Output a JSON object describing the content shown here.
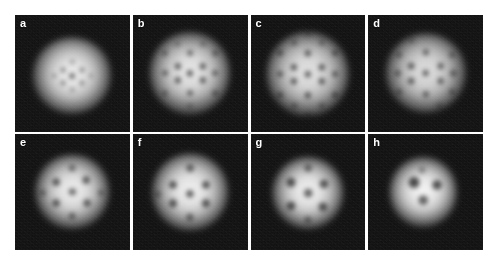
{
  "figure": {
    "kind": "absorption-image-grid",
    "columns": 4,
    "rows": 2,
    "background_color": "#ffffff",
    "panel_background_color": "#0a0a0a",
    "cloud_color": "#ffffff",
    "vortex_color": "#000000"
  },
  "chart_data": {
    "type": "heatmap",
    "title": "",
    "xlabel": "",
    "ylabel": "",
    "panels": [
      {
        "label": "a",
        "vortex_count": 9,
        "cloud": {
          "cx": 50,
          "cy": 52,
          "rx": 34,
          "ry": 33,
          "brightness": 0.92,
          "blur": 3.4
        },
        "vortices": [
          {
            "x": 50,
            "y": 52,
            "r": 3.0,
            "depth": 0.55
          },
          {
            "x": 42,
            "y": 47,
            "r": 2.6,
            "depth": 0.42
          },
          {
            "x": 58,
            "y": 47,
            "r": 2.6,
            "depth": 0.4
          },
          {
            "x": 42,
            "y": 58,
            "r": 2.6,
            "depth": 0.4
          },
          {
            "x": 58,
            "y": 58,
            "r": 2.6,
            "depth": 0.38
          },
          {
            "x": 50,
            "y": 40,
            "r": 2.4,
            "depth": 0.32
          },
          {
            "x": 50,
            "y": 64,
            "r": 2.4,
            "depth": 0.32
          },
          {
            "x": 34,
            "y": 52,
            "r": 2.4,
            "depth": 0.3
          },
          {
            "x": 66,
            "y": 52,
            "r": 2.4,
            "depth": 0.3
          }
        ]
      },
      {
        "label": "b",
        "vortex_count": 16,
        "cloud": {
          "cx": 50,
          "cy": 50,
          "rx": 35,
          "ry": 35,
          "brightness": 0.9,
          "blur": 3.2
        },
        "vortices": [
          {
            "x": 50,
            "y": 50,
            "r": 3.2,
            "depth": 0.62
          },
          {
            "x": 39,
            "y": 44,
            "r": 3.2,
            "depth": 0.6
          },
          {
            "x": 61,
            "y": 44,
            "r": 3.2,
            "depth": 0.6
          },
          {
            "x": 39,
            "y": 56,
            "r": 3.2,
            "depth": 0.6
          },
          {
            "x": 61,
            "y": 56,
            "r": 3.2,
            "depth": 0.6
          },
          {
            "x": 50,
            "y": 33,
            "r": 3.0,
            "depth": 0.52
          },
          {
            "x": 50,
            "y": 67,
            "r": 3.0,
            "depth": 0.52
          },
          {
            "x": 28,
            "y": 50,
            "r": 3.0,
            "depth": 0.5
          },
          {
            "x": 72,
            "y": 50,
            "r": 3.0,
            "depth": 0.5
          },
          {
            "x": 28,
            "y": 33,
            "r": 2.8,
            "depth": 0.42
          },
          {
            "x": 72,
            "y": 33,
            "r": 2.8,
            "depth": 0.42
          },
          {
            "x": 28,
            "y": 67,
            "r": 2.8,
            "depth": 0.42
          },
          {
            "x": 72,
            "y": 67,
            "r": 2.8,
            "depth": 0.42
          },
          {
            "x": 39,
            "y": 25,
            "r": 2.6,
            "depth": 0.34
          },
          {
            "x": 61,
            "y": 25,
            "r": 2.6,
            "depth": 0.34
          },
          {
            "x": 50,
            "y": 78,
            "r": 2.6,
            "depth": 0.32
          }
        ]
      },
      {
        "label": "c",
        "vortex_count": 19,
        "cloud": {
          "cx": 50,
          "cy": 51,
          "rx": 36,
          "ry": 36,
          "brightness": 0.88,
          "blur": 3.0
        },
        "vortices": [
          {
            "x": 50,
            "y": 51,
            "r": 3.2,
            "depth": 0.6
          },
          {
            "x": 38,
            "y": 45,
            "r": 3.2,
            "depth": 0.62
          },
          {
            "x": 62,
            "y": 45,
            "r": 3.2,
            "depth": 0.62
          },
          {
            "x": 38,
            "y": 57,
            "r": 3.2,
            "depth": 0.62
          },
          {
            "x": 62,
            "y": 57,
            "r": 3.2,
            "depth": 0.62
          },
          {
            "x": 50,
            "y": 33,
            "r": 3.2,
            "depth": 0.58
          },
          {
            "x": 50,
            "y": 69,
            "r": 3.2,
            "depth": 0.58
          },
          {
            "x": 26,
            "y": 51,
            "r": 3.0,
            "depth": 0.52
          },
          {
            "x": 74,
            "y": 51,
            "r": 3.0,
            "depth": 0.52
          },
          {
            "x": 26,
            "y": 33,
            "r": 3.0,
            "depth": 0.48
          },
          {
            "x": 74,
            "y": 33,
            "r": 3.0,
            "depth": 0.48
          },
          {
            "x": 26,
            "y": 69,
            "r": 3.0,
            "depth": 0.48
          },
          {
            "x": 74,
            "y": 69,
            "r": 3.0,
            "depth": 0.48
          },
          {
            "x": 38,
            "y": 24,
            "r": 2.8,
            "depth": 0.4
          },
          {
            "x": 62,
            "y": 24,
            "r": 2.8,
            "depth": 0.4
          },
          {
            "x": 38,
            "y": 78,
            "r": 2.8,
            "depth": 0.4
          },
          {
            "x": 62,
            "y": 78,
            "r": 2.8,
            "depth": 0.4
          },
          {
            "x": 50,
            "y": 86,
            "r": 2.6,
            "depth": 0.3
          },
          {
            "x": 50,
            "y": 16,
            "r": 2.6,
            "depth": 0.28
          }
        ]
      },
      {
        "label": "d",
        "vortex_count": 15,
        "cloud": {
          "cx": 50,
          "cy": 50,
          "rx": 35,
          "ry": 34,
          "brightness": 0.86,
          "blur": 3.2
        },
        "vortices": [
          {
            "x": 50,
            "y": 50,
            "r": 3.4,
            "depth": 0.58
          },
          {
            "x": 37,
            "y": 44,
            "r": 3.4,
            "depth": 0.58
          },
          {
            "x": 63,
            "y": 44,
            "r": 3.4,
            "depth": 0.56
          },
          {
            "x": 37,
            "y": 57,
            "r": 3.4,
            "depth": 0.56
          },
          {
            "x": 63,
            "y": 57,
            "r": 3.4,
            "depth": 0.56
          },
          {
            "x": 50,
            "y": 32,
            "r": 3.2,
            "depth": 0.5
          },
          {
            "x": 50,
            "y": 68,
            "r": 3.2,
            "depth": 0.5
          },
          {
            "x": 26,
            "y": 50,
            "r": 3.2,
            "depth": 0.46
          },
          {
            "x": 74,
            "y": 50,
            "r": 3.2,
            "depth": 0.46
          },
          {
            "x": 27,
            "y": 34,
            "r": 3.0,
            "depth": 0.4
          },
          {
            "x": 73,
            "y": 34,
            "r": 3.0,
            "depth": 0.4
          },
          {
            "x": 27,
            "y": 66,
            "r": 3.0,
            "depth": 0.4
          },
          {
            "x": 73,
            "y": 66,
            "r": 3.0,
            "depth": 0.4
          },
          {
            "x": 38,
            "y": 22,
            "r": 2.8,
            "depth": 0.3
          },
          {
            "x": 62,
            "y": 78,
            "r": 2.8,
            "depth": 0.3
          }
        ]
      },
      {
        "label": "e",
        "vortex_count": 9,
        "cloud": {
          "cx": 50,
          "cy": 50,
          "rx": 32,
          "ry": 32,
          "brightness": 0.93,
          "blur": 3.2
        },
        "vortices": [
          {
            "x": 50,
            "y": 50,
            "r": 3.6,
            "depth": 0.58
          },
          {
            "x": 36,
            "y": 42,
            "r": 3.8,
            "depth": 0.62
          },
          {
            "x": 62,
            "y": 40,
            "r": 3.8,
            "depth": 0.6
          },
          {
            "x": 36,
            "y": 60,
            "r": 3.8,
            "depth": 0.6
          },
          {
            "x": 63,
            "y": 60,
            "r": 3.8,
            "depth": 0.58
          },
          {
            "x": 50,
            "y": 30,
            "r": 3.4,
            "depth": 0.48
          },
          {
            "x": 50,
            "y": 71,
            "r": 3.4,
            "depth": 0.48
          },
          {
            "x": 24,
            "y": 51,
            "r": 3.2,
            "depth": 0.4
          },
          {
            "x": 75,
            "y": 51,
            "r": 3.2,
            "depth": 0.38
          }
        ]
      },
      {
        "label": "f",
        "vortex_count": 8,
        "cloud": {
          "cx": 50,
          "cy": 50,
          "rx": 33,
          "ry": 33,
          "brightness": 0.94,
          "blur": 3.2
        },
        "vortices": [
          {
            "x": 50,
            "y": 52,
            "r": 4.0,
            "depth": 0.64
          },
          {
            "x": 35,
            "y": 44,
            "r": 4.0,
            "depth": 0.66
          },
          {
            "x": 64,
            "y": 44,
            "r": 4.0,
            "depth": 0.66
          },
          {
            "x": 35,
            "y": 60,
            "r": 4.0,
            "depth": 0.64
          },
          {
            "x": 64,
            "y": 60,
            "r": 4.0,
            "depth": 0.64
          },
          {
            "x": 50,
            "y": 30,
            "r": 3.8,
            "depth": 0.56
          },
          {
            "x": 50,
            "y": 72,
            "r": 3.6,
            "depth": 0.5
          },
          {
            "x": 22,
            "y": 52,
            "r": 3.2,
            "depth": 0.36
          }
        ]
      },
      {
        "label": "g",
        "vortex_count": 7,
        "cloud": {
          "cx": 50,
          "cy": 51,
          "rx": 31,
          "ry": 31,
          "brightness": 0.94,
          "blur": 3.3
        },
        "vortices": [
          {
            "x": 50,
            "y": 51,
            "r": 4.2,
            "depth": 0.64
          },
          {
            "x": 35,
            "y": 42,
            "r": 4.4,
            "depth": 0.68
          },
          {
            "x": 64,
            "y": 43,
            "r": 4.4,
            "depth": 0.66
          },
          {
            "x": 35,
            "y": 62,
            "r": 4.4,
            "depth": 0.66
          },
          {
            "x": 63,
            "y": 63,
            "r": 4.4,
            "depth": 0.64
          },
          {
            "x": 50,
            "y": 30,
            "r": 3.8,
            "depth": 0.5
          },
          {
            "x": 50,
            "y": 74,
            "r": 3.6,
            "depth": 0.44
          }
        ]
      },
      {
        "label": "h",
        "vortex_count": 4,
        "cloud": {
          "cx": 48,
          "cy": 50,
          "rx": 29,
          "ry": 30,
          "brightness": 0.96,
          "blur": 3.4
        },
        "vortices": [
          {
            "x": 40,
            "y": 42,
            "r": 5.2,
            "depth": 0.76
          },
          {
            "x": 60,
            "y": 44,
            "r": 4.8,
            "depth": 0.7
          },
          {
            "x": 48,
            "y": 57,
            "r": 4.6,
            "depth": 0.64
          },
          {
            "x": 47,
            "y": 31,
            "r": 3.4,
            "depth": 0.36
          }
        ]
      }
    ]
  }
}
